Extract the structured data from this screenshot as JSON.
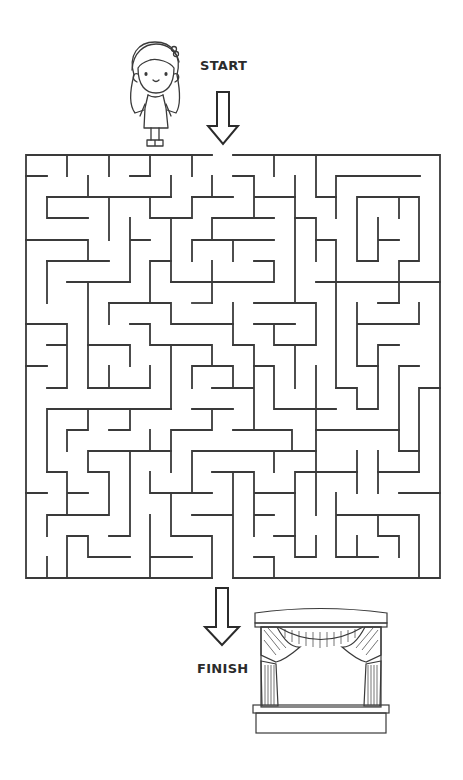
{
  "puzzle": {
    "type": "maze",
    "start_label": "START",
    "finish_label": "FINISH",
    "grid": {
      "cols": 20,
      "rows": 20
    },
    "start_character": "girl-character",
    "finish_goal": "theater-stage",
    "entry_column": 10,
    "exit_column": 10
  },
  "colors": {
    "wall": "#3a3a3a",
    "background": "#ffffff",
    "text": "#2b2b2b"
  }
}
